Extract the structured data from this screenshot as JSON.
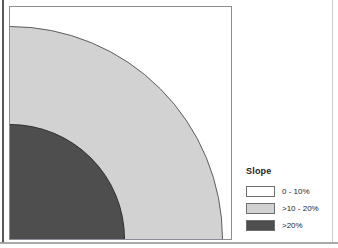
{
  "figure": {
    "type": "map"
  },
  "map": {
    "name": "slope-map",
    "zones": [
      {
        "key": "low",
        "label": "0 - 10%",
        "color": "#ffffff",
        "radius_px": null
      },
      {
        "key": "mid",
        "label": ">10 - 20%",
        "color": "#d2d2d2",
        "radius_px": 213
      },
      {
        "key": "high",
        "label": ">20%",
        "color": "#4e4e4e",
        "radius_px": 115
      }
    ]
  },
  "legend": {
    "title": "Slope",
    "items": [
      {
        "label": "0 - 10%",
        "color": "#ffffff"
      },
      {
        "label": ">10 - 20%",
        "color": "#d2d2d2"
      },
      {
        "label": ">20%",
        "color": "#4e4e4e"
      }
    ]
  }
}
